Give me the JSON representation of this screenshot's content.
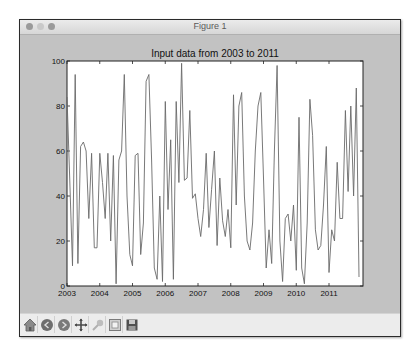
{
  "window": {
    "title": "Figure 1"
  },
  "toolbar": {
    "buttons": [
      {
        "name": "home",
        "icon": "home-icon"
      },
      {
        "name": "back",
        "icon": "back-arrow-icon"
      },
      {
        "name": "forward",
        "icon": "forward-arrow-icon"
      },
      {
        "name": "pan",
        "icon": "pan-move-icon"
      },
      {
        "name": "zoom",
        "icon": "zoom-rect-icon"
      },
      {
        "name": "subplots",
        "icon": "configure-subplots-icon"
      },
      {
        "name": "save",
        "icon": "save-disk-icon"
      }
    ]
  },
  "chart_data": {
    "type": "line",
    "title": "Input data from 2003 to 2011",
    "xlabel": "",
    "ylabel": "",
    "xlim": [
      2003,
      2012
    ],
    "ylim": [
      0,
      100
    ],
    "x_ticks": [
      "2003",
      "2004",
      "2005",
      "2006",
      "2007",
      "2008",
      "2009",
      "2010",
      "2011"
    ],
    "y_ticks": [
      "0",
      "20",
      "40",
      "60",
      "80",
      "100"
    ],
    "grid": false,
    "legend": null,
    "line_color": "#6a6a6a",
    "series": [
      {
        "name": "monthly",
        "start": "2003-01",
        "frequency": "M",
        "values": [
          84,
          48,
          9,
          94,
          10,
          62,
          64,
          60,
          30,
          59,
          17,
          17,
          59,
          46,
          30,
          59,
          20,
          58,
          1,
          56,
          60,
          94,
          40,
          14,
          9,
          58,
          59,
          14,
          28,
          91,
          94,
          56,
          8,
          3,
          40,
          2,
          82,
          34,
          65,
          3,
          82,
          46,
          99,
          47,
          48,
          78,
          39,
          41,
          30,
          22,
          34,
          59,
          26,
          43,
          60,
          18,
          48,
          29,
          22,
          34,
          17,
          85,
          36,
          80,
          86,
          40,
          20,
          16,
          28,
          60,
          80,
          86,
          48,
          8,
          25,
          10,
          60,
          98,
          20,
          2,
          30,
          32,
          20,
          36,
          7,
          75,
          8,
          1,
          28,
          83,
          67,
          25,
          16,
          18,
          36,
          62,
          6,
          25,
          20,
          55,
          30,
          30,
          78,
          42,
          80,
          40,
          88,
          4
        ]
      }
    ]
  },
  "colors": {
    "figure_bg": "#c2c2c2",
    "axes_bg": "#ffffff",
    "line": "#6a6a6a",
    "toolbar_bg": "#ececec"
  }
}
